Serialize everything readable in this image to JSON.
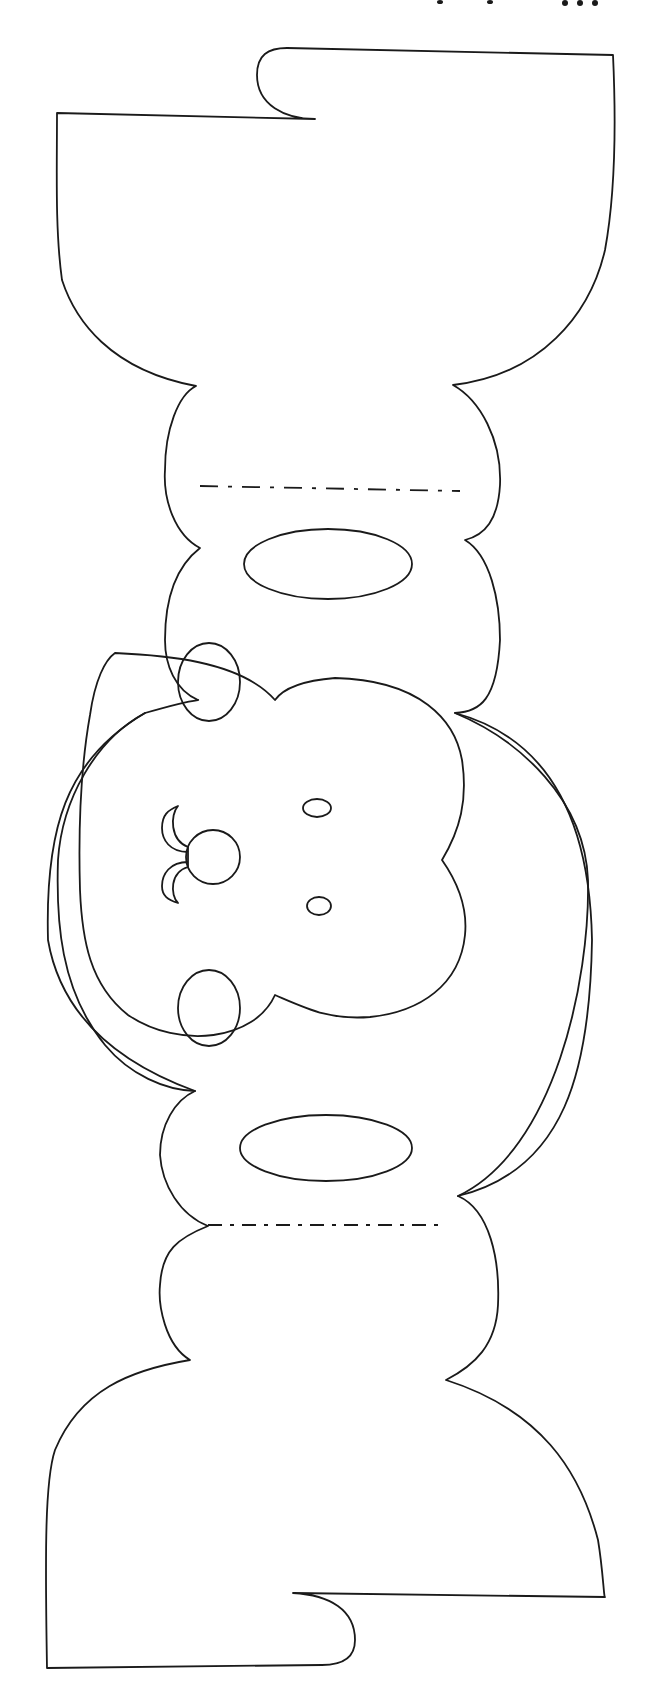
{
  "template": {
    "subject": "monkey face papercraft template",
    "line_color": "#1a1a1a",
    "background": "#ffffff",
    "orientation": "rotated 90 degrees (face reads sideways)"
  },
  "parts": {
    "top_tab": "top-flap",
    "top_cap": "top-head-cap",
    "upper_ring": "upper-ear-band",
    "face_frame": "outer-face-frame",
    "face": "inner-face",
    "lower_ring": "lower-ear-band",
    "bottom_cap": "bottom-head-cap",
    "bottom_tab": "bottom-flap"
  },
  "fold_lines": [
    {
      "name": "upper-fold-line",
      "y": 488
    },
    {
      "name": "lower-fold-line",
      "y": 1225
    }
  ],
  "features": {
    "eyes": [
      "upper-eye",
      "lower-eye"
    ],
    "nostrils": [
      "upper-nostril",
      "lower-nostril"
    ],
    "nose": "nose",
    "mouth": "mouth-curl",
    "slots": [
      "upper-slot",
      "lower-slot"
    ]
  }
}
